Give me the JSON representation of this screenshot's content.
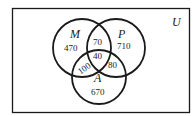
{
  "diagram": {
    "type": "venn-3-set",
    "universe": {
      "label": "U"
    },
    "sets": [
      {
        "id": "M",
        "label": "M"
      },
      {
        "id": "P",
        "label": "P"
      },
      {
        "id": "A",
        "label": "A"
      }
    ],
    "regions": {
      "M_only": "470",
      "P_only": "710",
      "A_only": "670",
      "M_and_P_only": "70",
      "M_and_A_only": "100",
      "P_and_A_only": "80",
      "M_and_P_and_A": "40"
    },
    "colors": {
      "stroke": "#1a1a1a",
      "background": "#ffffff"
    }
  }
}
